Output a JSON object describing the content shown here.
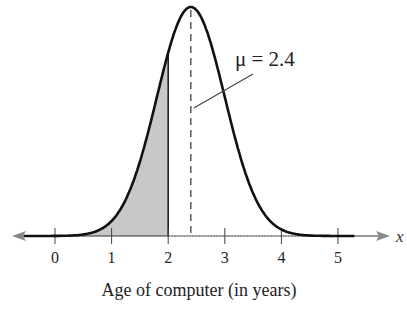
{
  "chart_data": {
    "type": "area",
    "title": "",
    "distribution": "normal",
    "mean": 2.4,
    "std_dev_estimate": 0.6,
    "shaded_region": {
      "from": "-inf",
      "to": 2,
      "color": "#c8c8c8"
    },
    "mean_line": {
      "x": 2.4,
      "style": "dashed"
    },
    "annotation": {
      "text": "μ = 2.4",
      "points_to": 2.4
    },
    "xlabel": "Age of computer (in years)",
    "x_variable": "x",
    "x_ticks": [
      0,
      1,
      2,
      3,
      4,
      5
    ],
    "x_tick_labels": [
      "0",
      "1",
      "2",
      "3",
      "4",
      "5"
    ],
    "xlim": [
      -0.7,
      5.5
    ],
    "ylabel": "",
    "grid": false,
    "legend": null,
    "curve_color": "#111111"
  }
}
